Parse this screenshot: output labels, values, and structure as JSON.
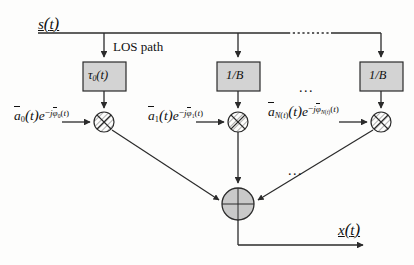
{
  "diagram": {
    "input_signal_label": "s(t)",
    "output_signal_label": "x(t)",
    "los_annotation": "LOS path",
    "ellipsis": "...",
    "blocks": [
      {
        "id": "tau0",
        "label": "τ0(t)",
        "label_base": "τ",
        "label_sub": "0",
        "label_tail": "(t)",
        "x": 83,
        "y": 62,
        "w": 43,
        "h": 29,
        "fill": "#d3d3d3"
      },
      {
        "id": "delay1",
        "label": "1/B",
        "x": 217,
        "y": 62,
        "w": 43,
        "h": 29,
        "fill": "#d3d3d3"
      },
      {
        "id": "delay_n",
        "label": "1/B",
        "x": 360,
        "y": 62,
        "w": 43,
        "h": 29,
        "fill": "#d3d3d3"
      }
    ],
    "multipliers": [
      {
        "id": "mult0",
        "cx": 104,
        "cy": 122,
        "r": 10
      },
      {
        "id": "mult1",
        "cx": 238,
        "cy": 122,
        "r": 10
      },
      {
        "id": "mult_n",
        "cx": 381,
        "cy": 122,
        "r": 10
      }
    ],
    "coefficients": [
      {
        "id": "coef0",
        "a_sub": "0",
        "phi_sub": "0",
        "text": "a̅0(t)e⁻ʲφ̅0(t)",
        "x": 14,
        "y": 107
      },
      {
        "id": "coef1",
        "a_sub": "1",
        "phi_sub": "1",
        "text": "a̅1(t)e⁻ʲφ̅1(t)",
        "x": 148,
        "y": 107
      },
      {
        "id": "coef_n",
        "a_sub": "N(t)",
        "phi_sub": "N(t)",
        "text": "a̅N(t)(t)e⁻ʲφ̅N(t)(t)",
        "x": 268,
        "y": 103
      }
    ],
    "summer": {
      "id": "summing-junction",
      "cx": 238,
      "cy": 204,
      "r": 16,
      "fill": "#c9c9c9"
    },
    "bus_line_y": 33,
    "colors": {
      "line": "#2b2b2b",
      "block_fill": "#d3d3d3",
      "summer_fill": "#c9c9c9",
      "text": "#111111"
    }
  }
}
